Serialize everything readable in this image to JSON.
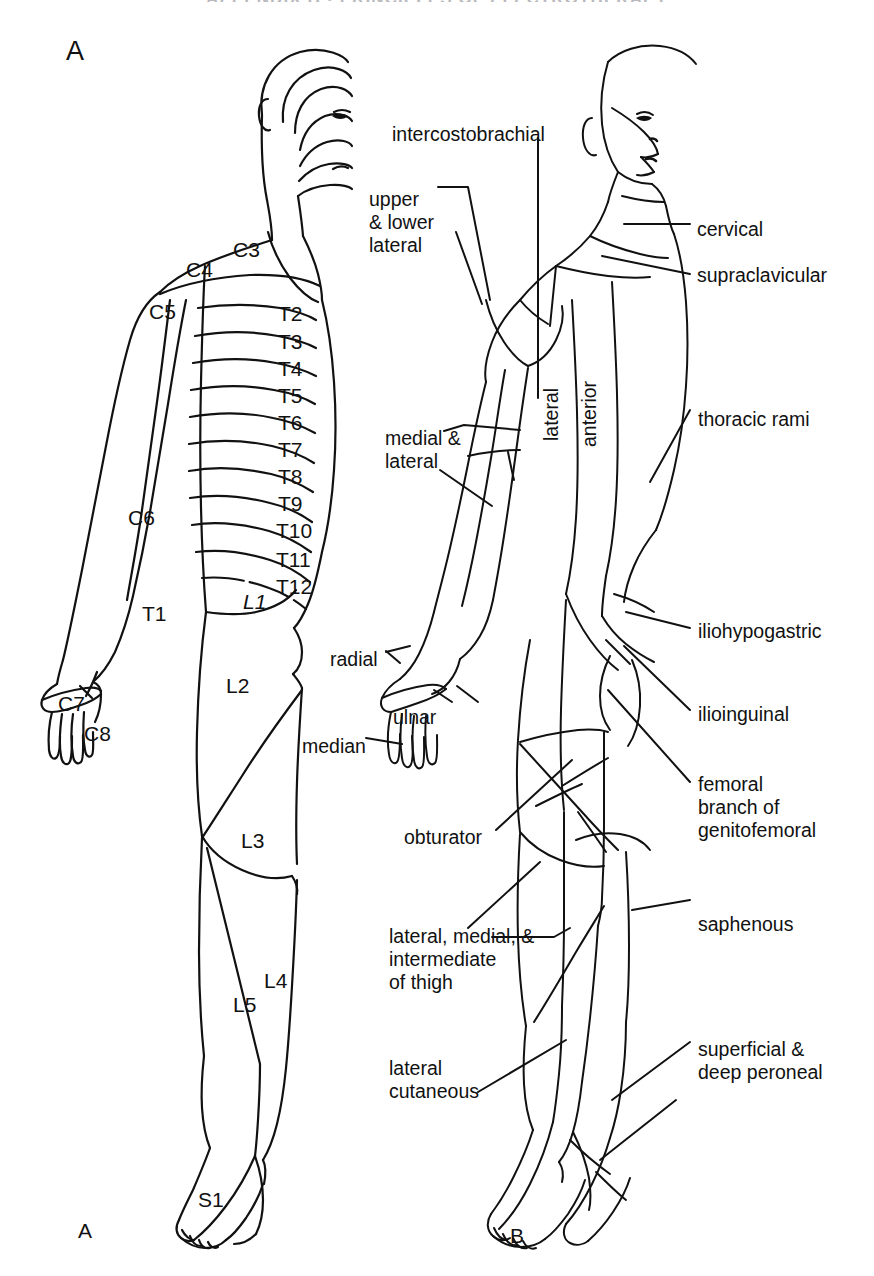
{
  "page": {
    "cut_off_running_head": "APPENDIX  B   •   PRINCIPLES OF ELECTROTHERAPY",
    "panel_a_letter_top": "A",
    "panel_a_letter_bottom": "A",
    "panel_b_letter_bottom": "B"
  },
  "figure_a": {
    "caption_letter": "A",
    "description": "Posterior view of body showing segmental dermatome boundaries",
    "dermatomes": [
      {
        "label": "C3",
        "x": 233,
        "y": 238
      },
      {
        "label": "C4",
        "x": 186,
        "y": 258
      },
      {
        "label": "C5",
        "x": 149,
        "y": 300
      },
      {
        "label": "C6",
        "x": 128,
        "y": 506
      },
      {
        "label": "C7",
        "x": 58,
        "y": 692
      },
      {
        "label": "C8",
        "x": 84,
        "y": 722
      },
      {
        "label": "T1",
        "x": 142,
        "y": 602
      },
      {
        "label": "T2",
        "x": 278,
        "y": 302
      },
      {
        "label": "T3",
        "x": 278,
        "y": 330
      },
      {
        "label": "T4",
        "x": 278,
        "y": 357
      },
      {
        "label": "T5",
        "x": 278,
        "y": 384
      },
      {
        "label": "T6",
        "x": 278,
        "y": 411
      },
      {
        "label": "T7",
        "x": 278,
        "y": 438
      },
      {
        "label": "T8",
        "x": 278,
        "y": 465
      },
      {
        "label": "T9",
        "x": 278,
        "y": 492
      },
      {
        "label": "T10",
        "x": 276,
        "y": 519
      },
      {
        "label": "T11",
        "x": 276,
        "y": 548
      },
      {
        "label": "T12",
        "x": 276,
        "y": 575
      },
      {
        "label": "L1",
        "x": 243,
        "y": 590,
        "italic": true
      },
      {
        "label": "L2",
        "x": 226,
        "y": 674
      },
      {
        "label": "L3",
        "x": 241,
        "y": 829
      },
      {
        "label": "L4",
        "x": 264,
        "y": 969
      },
      {
        "label": "L5",
        "x": 233,
        "y": 993
      },
      {
        "label": "S1",
        "x": 198,
        "y": 1188
      }
    ]
  },
  "figure_b": {
    "caption_letter": "B",
    "description": "Anterior view of body showing peripheral cutaneous nerve distributions",
    "nerve_labels": [
      {
        "label": "intercostobrachial",
        "x": 392,
        "y": 123,
        "align": "left"
      },
      {
        "label": "upper\n& lower\nlateral",
        "x": 369,
        "y": 188,
        "align": "left"
      },
      {
        "label": "cervical",
        "x": 697,
        "y": 218,
        "align": "left"
      },
      {
        "label": "supraclavicular",
        "x": 697,
        "y": 264,
        "align": "left"
      },
      {
        "label": "lateral",
        "x": 540,
        "y": 441,
        "rotated": true
      },
      {
        "label": "anterior",
        "x": 578,
        "y": 447,
        "rotated": true
      },
      {
        "label": "thoracic rami",
        "x": 698,
        "y": 408,
        "align": "left"
      },
      {
        "label": "medial &\nlateral",
        "x": 385,
        "y": 427,
        "align": "left"
      },
      {
        "label": "radial",
        "x": 330,
        "y": 648,
        "align": "left"
      },
      {
        "label": "ulnar",
        "x": 393,
        "y": 706,
        "align": "left"
      },
      {
        "label": "median",
        "x": 302,
        "y": 735,
        "align": "left"
      },
      {
        "label": "iliohypogastric",
        "x": 698,
        "y": 620,
        "align": "left"
      },
      {
        "label": "ilioinguinal",
        "x": 698,
        "y": 703,
        "align": "left"
      },
      {
        "label": "femoral\nbranch of\ngenitofemoral",
        "x": 698,
        "y": 773,
        "align": "left"
      },
      {
        "label": "obturator",
        "x": 404,
        "y": 826,
        "align": "left"
      },
      {
        "label": "lateral, medial, &\nintermediate\nof thigh",
        "x": 389,
        "y": 925,
        "align": "left"
      },
      {
        "label": "saphenous",
        "x": 698,
        "y": 913,
        "align": "left"
      },
      {
        "label": "superficial &\ndeep peroneal",
        "x": 698,
        "y": 1038,
        "align": "left"
      },
      {
        "label": "lateral\ncutaneous",
        "x": 389,
        "y": 1057,
        "align": "left"
      }
    ]
  },
  "style": {
    "ink": "#111111",
    "paper": "#ffffff",
    "line_width": 2.0
  }
}
